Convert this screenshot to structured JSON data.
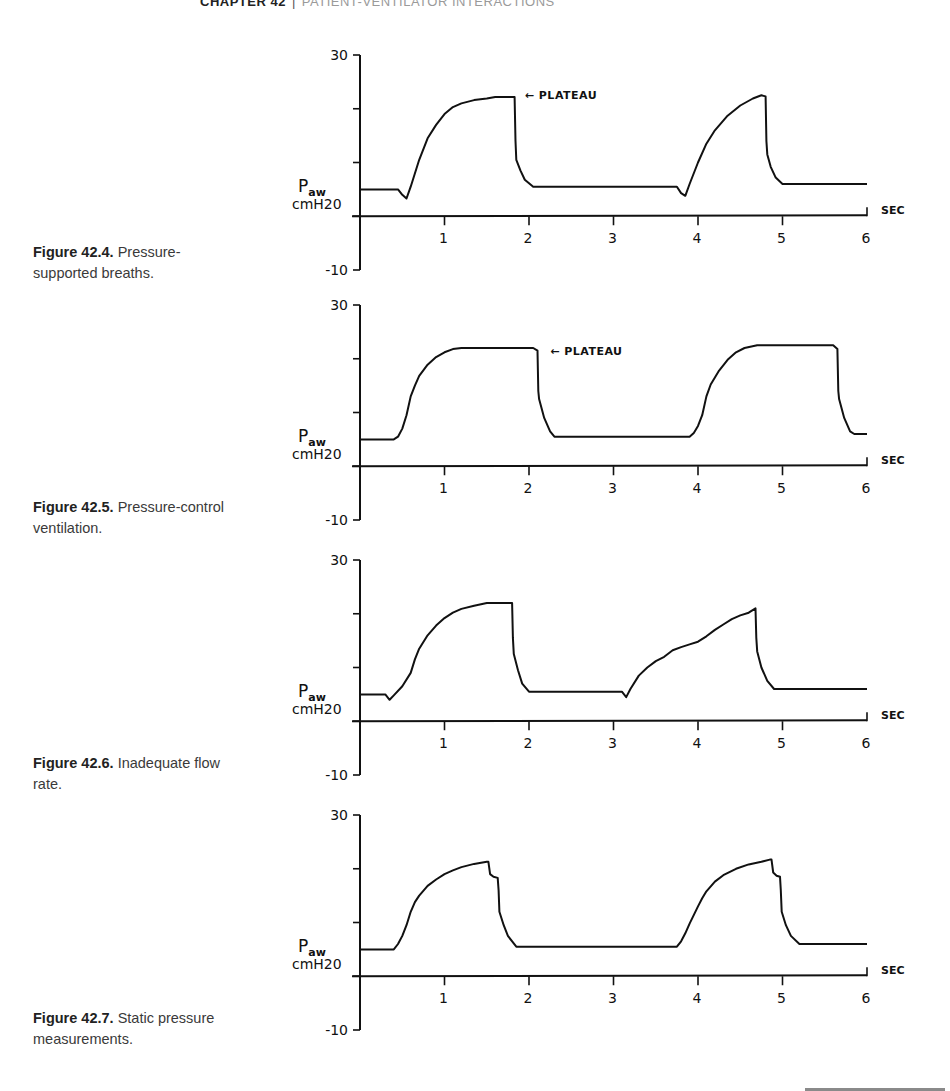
{
  "running_head": {
    "chapter": "CHAPTER 42",
    "separator": "|",
    "title": "PATIENT-VENTILATOR INTERACTIONS"
  },
  "figures": [
    {
      "label": "Figure 42.4.",
      "caption": "Pressure-supported breaths.",
      "top": 40,
      "caption_top": 242
    },
    {
      "label": "Figure 42.5.",
      "caption": "Pressure-control ventilation.",
      "top": 290,
      "caption_top": 497
    },
    {
      "label": "Figure 42.6.",
      "caption": "Inadequate flow rate.",
      "top": 545,
      "caption_top": 753
    },
    {
      "label": "Figure 42.7.",
      "caption": "Static pressure measurements.",
      "top": 800,
      "caption_top": 1008
    }
  ],
  "chart_data": [
    {
      "type": "line",
      "title": "Figure 42.4. Pressure-supported breaths.",
      "xlabel": "SEC",
      "ylabel": "Paw cmH20",
      "ylabel_main": "P",
      "ylabel_sub": "aw",
      "ylabel_unit": "cmH20",
      "xlim": [
        0,
        6
      ],
      "ylim": [
        -10,
        30
      ],
      "x_ticks": [
        1,
        2,
        3,
        4,
        5,
        6
      ],
      "y_ticks": [
        30,
        20,
        10,
        0,
        -10
      ],
      "y_tick_labels": [
        "30",
        "",
        "",
        "",
        "-10"
      ],
      "grid": false,
      "annotation": {
        "text": "PLATEAU",
        "arrow": "←",
        "x": 1.95,
        "y": 22.5
      },
      "series": [
        {
          "name": "Airway pressure",
          "x": [
            0,
            0.45,
            0.5,
            0.55,
            0.6,
            0.7,
            0.8,
            0.9,
            1.0,
            1.1,
            1.2,
            1.35,
            1.5,
            1.6,
            1.83,
            1.84,
            1.85,
            1.9,
            1.95,
            2.05,
            2.1,
            3.75,
            3.8,
            3.85,
            3.9,
            4.0,
            4.1,
            4.2,
            4.35,
            4.5,
            4.65,
            4.75,
            4.8,
            4.81,
            4.82,
            4.86,
            4.92,
            5.0,
            5.05,
            6.0
          ],
          "values": [
            5,
            5,
            4,
            3.3,
            5.5,
            10.5,
            14.5,
            17,
            19,
            20.3,
            21,
            21.6,
            21.9,
            22.2,
            22.2,
            14,
            10.5,
            8.5,
            6.8,
            5.5,
            5.5,
            5.5,
            4.3,
            3.8,
            6,
            10,
            13.5,
            16,
            18.7,
            20.6,
            21.9,
            22.5,
            22.3,
            14,
            11.5,
            9.2,
            7.2,
            6,
            6,
            6
          ]
        }
      ]
    },
    {
      "type": "line",
      "title": "Figure 42.5. Pressure-control ventilation.",
      "xlabel": "SEC",
      "ylabel": "Paw cmH20",
      "ylabel_main": "P",
      "ylabel_sub": "aw",
      "ylabel_unit": "cmH20",
      "xlim": [
        0,
        6
      ],
      "ylim": [
        -10,
        30
      ],
      "x_ticks": [
        1,
        2,
        3,
        4,
        5,
        6
      ],
      "y_ticks": [
        30,
        20,
        10,
        0,
        -10
      ],
      "y_tick_labels": [
        "30",
        "",
        "",
        "",
        "-10"
      ],
      "grid": false,
      "annotation": {
        "text": "PLATEAU",
        "arrow": "←",
        "x": 2.25,
        "y": 21.5
      },
      "series": [
        {
          "name": "Airway pressure",
          "x": [
            0,
            0.4,
            0.45,
            0.5,
            0.55,
            0.6,
            0.65,
            0.7,
            0.8,
            0.9,
            1.0,
            1.1,
            1.2,
            2.05,
            2.1,
            2.11,
            2.12,
            2.18,
            2.25,
            2.3,
            3.9,
            3.95,
            4.0,
            4.05,
            4.1,
            4.15,
            4.25,
            4.35,
            4.45,
            4.55,
            4.7,
            5.6,
            5.65,
            5.66,
            5.67,
            5.73,
            5.8,
            5.85,
            6.0
          ],
          "values": [
            5,
            5,
            5.5,
            7,
            9.5,
            13,
            15,
            16.8,
            18.9,
            20.3,
            21.2,
            21.8,
            22,
            22,
            21.5,
            14,
            12.5,
            9,
            6.5,
            5.5,
            5.5,
            6.2,
            7.5,
            9.5,
            13,
            15.2,
            17.8,
            19.8,
            21.2,
            22,
            22.5,
            22.5,
            21.8,
            14,
            12.5,
            9,
            6.5,
            6,
            6
          ]
        }
      ]
    },
    {
      "type": "line",
      "title": "Figure 42.6. Inadequate flow rate.",
      "xlabel": "SEC",
      "ylabel": "Paw cmH20",
      "ylabel_main": "P",
      "ylabel_sub": "aw",
      "ylabel_unit": "cmH20",
      "xlim": [
        0,
        6
      ],
      "ylim": [
        -10,
        30
      ],
      "x_ticks": [
        1,
        2,
        3,
        4,
        5,
        6
      ],
      "y_ticks": [
        30,
        20,
        10,
        0,
        -10
      ],
      "y_tick_labels": [
        "30",
        "",
        "",
        "",
        "-10"
      ],
      "grid": false,
      "annotation": null,
      "series": [
        {
          "name": "Airway pressure",
          "x": [
            0,
            0.3,
            0.35,
            0.4,
            0.5,
            0.6,
            0.65,
            0.7,
            0.8,
            0.9,
            1.0,
            1.1,
            1.2,
            1.35,
            1.5,
            1.8,
            1.81,
            1.82,
            1.87,
            1.92,
            2.0,
            3.1,
            3.15,
            3.2,
            3.3,
            3.4,
            3.5,
            3.6,
            3.7,
            3.8,
            3.9,
            4.0,
            4.1,
            4.2,
            4.3,
            4.4,
            4.5,
            4.6,
            4.68,
            4.69,
            4.7,
            4.75,
            4.82,
            4.9,
            6.0
          ],
          "values": [
            5,
            5,
            4,
            4.8,
            6.5,
            9,
            11.5,
            13.5,
            16,
            17.8,
            19.2,
            20.2,
            20.9,
            21.5,
            22,
            22,
            15.5,
            12.5,
            9.5,
            7,
            5.5,
            5.5,
            4.5,
            6,
            8.5,
            10,
            11.2,
            12,
            13.2,
            13.8,
            14.3,
            14.8,
            15.8,
            17,
            18,
            19,
            19.7,
            20.2,
            21,
            15.5,
            13,
            10,
            7.5,
            6,
            6
          ]
        }
      ]
    },
    {
      "type": "line",
      "title": "Figure 42.7. Static pressure measurements.",
      "xlabel": "SEC",
      "ylabel": "Paw cmH20",
      "ylabel_main": "P",
      "ylabel_sub": "aw",
      "ylabel_unit": "cmH20",
      "xlim": [
        0,
        6
      ],
      "ylim": [
        -10,
        30
      ],
      "x_ticks": [
        1,
        2,
        3,
        4,
        5,
        6
      ],
      "y_ticks": [
        30,
        20,
        10,
        0,
        -10
      ],
      "y_tick_labels": [
        "30",
        "",
        "",
        "",
        "-10"
      ],
      "grid": false,
      "annotation": null,
      "series": [
        {
          "name": "Airway pressure",
          "x": [
            0,
            0.4,
            0.45,
            0.5,
            0.55,
            0.6,
            0.65,
            0.7,
            0.8,
            0.9,
            1.0,
            1.1,
            1.2,
            1.35,
            1.5,
            1.52,
            1.54,
            1.58,
            1.63,
            1.64,
            1.65,
            1.7,
            1.75,
            1.85,
            3.75,
            3.8,
            3.85,
            3.9,
            4.0,
            4.05,
            4.1,
            4.2,
            4.3,
            4.45,
            4.6,
            4.75,
            4.85,
            4.87,
            4.89,
            4.93,
            4.97,
            4.98,
            4.99,
            5.04,
            5.1,
            5.2,
            6.0
          ],
          "values": [
            5,
            5,
            6,
            7.5,
            9.5,
            12,
            13.8,
            15,
            16.8,
            18,
            19,
            19.7,
            20.3,
            20.9,
            21.3,
            21.3,
            19,
            18.5,
            18.3,
            16,
            12,
            9.5,
            7.5,
            5.5,
            5.5,
            6.5,
            8,
            9.8,
            13,
            14.5,
            15.8,
            17.6,
            18.8,
            20,
            20.8,
            21.3,
            21.7,
            21.7,
            19.3,
            18.7,
            18.5,
            16,
            12,
            9.5,
            7.5,
            6,
            6
          ]
        }
      ]
    }
  ],
  "page": {
    "bottom_rule_color": "#8a8a8a",
    "trace_color": "#111111"
  }
}
